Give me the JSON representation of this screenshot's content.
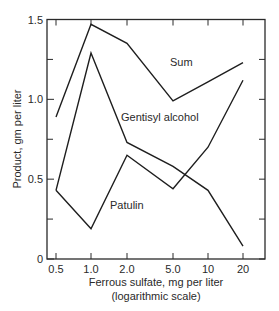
{
  "chart_data": {
    "type": "line",
    "title": "",
    "xlabel": "Ferrous sulfate, mg per liter",
    "xlabel_note": "(logarithmic scale)",
    "ylabel": "Product, gm per liter",
    "x_scale": "log",
    "categories": [
      "0.5",
      "1.0",
      "2.0",
      "5.0",
      "10",
      "20"
    ],
    "x": [
      0.5,
      1.0,
      2.0,
      5.0,
      10,
      20
    ],
    "yticks": [
      "0",
      "0.5",
      "1.0",
      "1.5"
    ],
    "ylim": [
      0,
      1.5
    ],
    "grid": false,
    "legend": "inline labels",
    "series": [
      {
        "name": "Sum",
        "values": [
          0.89,
          1.47,
          1.35,
          0.99,
          1.11,
          1.23
        ]
      },
      {
        "name": "Gentisyl alcohol",
        "values": [
          0.43,
          1.29,
          0.73,
          0.58,
          0.43,
          0.08
        ]
      },
      {
        "name": "Patulin",
        "values": [
          0.43,
          0.19,
          0.65,
          0.44,
          0.7,
          1.12
        ]
      }
    ]
  }
}
